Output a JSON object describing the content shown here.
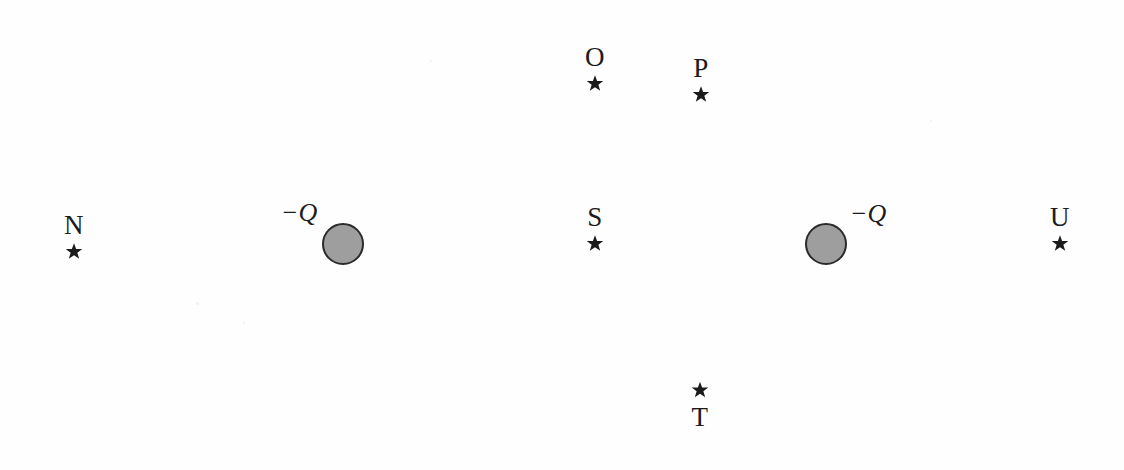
{
  "figure": {
    "width": 1124,
    "height": 470,
    "background_color": "#fefefe",
    "ink_color": "#1b1b1b",
    "charge_fill_color": "#9e9e9e",
    "charge_stroke_color": "#2b2b2b"
  },
  "points": [
    {
      "id": "N",
      "label": "N",
      "star_icon": "star-icon",
      "label_position": "above",
      "x": 74,
      "y": 228,
      "star_x": 74,
      "star_y": 243
    },
    {
      "id": "O",
      "label": "O",
      "star_icon": "star-icon",
      "label_position": "above",
      "x": 595,
      "y": 57,
      "star_x": 595,
      "star_y": 83
    },
    {
      "id": "P",
      "label": "P",
      "star_icon": "star-icon",
      "label_position": "above",
      "x": 703,
      "y": 68,
      "star_x": 700,
      "star_y": 94
    },
    {
      "id": "S",
      "label": "S",
      "star_icon": "star-icon",
      "label_position": "above",
      "x": 595,
      "y": 217,
      "star_x": 595,
      "star_y": 243
    },
    {
      "id": "T",
      "label": "T",
      "star_icon": "star-icon",
      "label_position": "below",
      "x": 700,
      "y": 419,
      "star_x": 700,
      "star_y": 391
    },
    {
      "id": "U",
      "label": "U",
      "star_icon": "star-icon",
      "label_position": "above",
      "x": 1060,
      "y": 217,
      "star_x": 1060,
      "star_y": 243
    }
  ],
  "charges": [
    {
      "id": "left-charge",
      "sign": "−",
      "symbol": "Q",
      "label": "−Q",
      "label_x": 299,
      "label_y": 213,
      "circle_x": 343,
      "circle_y": 244,
      "diameter": 38
    },
    {
      "id": "right-charge",
      "sign": "−",
      "symbol": "Q",
      "label": "−Q",
      "label_x": 868,
      "label_y": 214,
      "circle_x": 826,
      "circle_y": 244,
      "diameter": 38
    }
  ]
}
